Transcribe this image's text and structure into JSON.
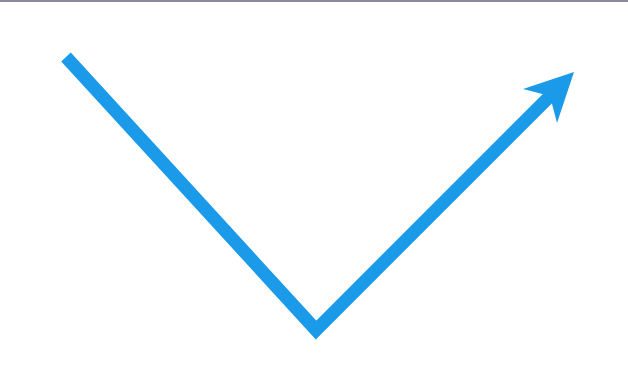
{
  "figure": {
    "type": "v-shaped-arrow",
    "background_color": "#ffffff",
    "top_border_color": "#8a8a9a",
    "stroke_color": "#1a9ae8",
    "stroke_width": 13,
    "points": {
      "start": [
        66,
        57
      ],
      "vertex": [
        316,
        330
      ],
      "end": [
        574,
        72
      ]
    },
    "arrowhead": {
      "tip": [
        574,
        72
      ],
      "direction": "up-right"
    }
  }
}
